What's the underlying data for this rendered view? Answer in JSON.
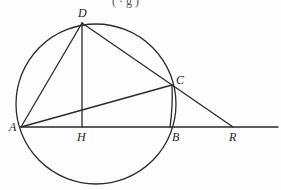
{
  "diagram": {
    "type": "geometry",
    "top_caption_fragment": "( ·   g )",
    "points": {
      "A": {
        "label": "A"
      },
      "B": {
        "label": "B"
      },
      "C": {
        "label": "C"
      },
      "D": {
        "label": "D"
      },
      "H": {
        "label": "H"
      },
      "R": {
        "label": "R"
      }
    },
    "segments": [
      {
        "from": "A",
        "to": "D"
      },
      {
        "from": "D",
        "to": "H"
      },
      {
        "from": "D",
        "to": "R"
      },
      {
        "from": "A",
        "to": "C"
      },
      {
        "from": "C",
        "to": "B"
      },
      {
        "from": "A",
        "to": "R",
        "extended": true
      }
    ],
    "circle": {
      "through": [
        "A",
        "D",
        "C",
        "B"
      ]
    },
    "relations": [
      "DH ⟂ AB",
      "D, C, R collinear",
      "A, H, B, R collinear"
    ],
    "stroke_color": "#2a2a2a",
    "background_color": "#fdfdfd"
  }
}
